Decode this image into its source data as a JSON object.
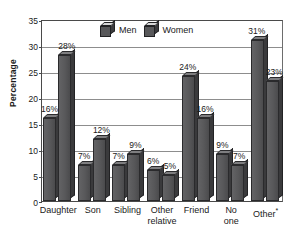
{
  "chart_data": {
    "type": "bar",
    "title": "",
    "xlabel": "",
    "ylabel": "Percentage",
    "ylim": [
      0,
      35
    ],
    "yticks": [
      0,
      5,
      10,
      15,
      20,
      25,
      30,
      35
    ],
    "ytick_labels": [
      "0",
      "5",
      "10",
      "15",
      "20",
      "25",
      "30",
      "35"
    ],
    "grid": true,
    "legend_position": "top-center",
    "categories": [
      "Daughter",
      "Son",
      "Sibling",
      "Other relative",
      "Friend",
      "No one",
      "Other*"
    ],
    "category_labels": [
      {
        "line1": "Daughter",
        "line2": ""
      },
      {
        "line1": "Son",
        "line2": ""
      },
      {
        "line1": "Sibling",
        "line2": ""
      },
      {
        "line1": "Other",
        "line2": "relative"
      },
      {
        "line1": "Friend",
        "line2": ""
      },
      {
        "line1": "No",
        "line2": "one"
      },
      {
        "line1": "Other",
        "line2": "",
        "superscript": "*"
      }
    ],
    "series": [
      {
        "name": "Men",
        "color": "#58585a",
        "values": [
          16,
          7,
          7,
          6,
          24,
          9,
          31
        ],
        "value_labels": [
          "16%",
          "7%",
          "7%",
          "6%",
          "24%",
          "9%",
          "31%"
        ]
      },
      {
        "name": "Women",
        "color": "#58585a",
        "values": [
          28,
          12,
          9,
          5,
          16,
          7,
          23
        ],
        "value_labels": [
          "28%",
          "12%",
          "9%",
          "5%",
          "16%",
          "7%",
          "23%"
        ]
      }
    ]
  },
  "legend": {
    "items": [
      {
        "label": "Men",
        "icon": "cube-icon"
      },
      {
        "label": "Women",
        "icon": "cube-icon"
      }
    ]
  },
  "colors": {
    "bar_face": "#58585a",
    "bar_side": "#3a3a3c",
    "bar_top": "#7e7e80",
    "gridline": "#8d8d8d",
    "axis": "#4a4a4a",
    "text": "#1a1a1a",
    "background": "#ffffff"
  }
}
